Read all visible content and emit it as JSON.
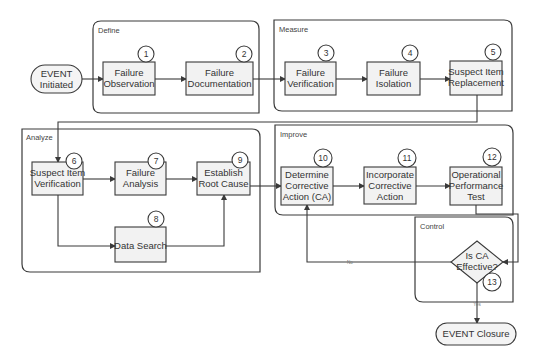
{
  "groups": {
    "define": "Define",
    "measure": "Measure",
    "analyze": "Analyze",
    "improve": "Improve",
    "control": "Control"
  },
  "terminals": {
    "start": [
      "EVENT",
      "Initiated"
    ],
    "end": "EVENT Closure"
  },
  "steps": [
    {
      "num": "1",
      "lines": [
        "Failure",
        "Observation"
      ]
    },
    {
      "num": "2",
      "lines": [
        "Failure",
        "Documentation"
      ]
    },
    {
      "num": "3",
      "lines": [
        "Failure",
        "Verification"
      ]
    },
    {
      "num": "4",
      "lines": [
        "Failure",
        "Isolation"
      ]
    },
    {
      "num": "5",
      "lines": [
        "Suspect Item",
        "Replacement"
      ]
    },
    {
      "num": "6",
      "lines": [
        "Suspect Item",
        "Verification"
      ]
    },
    {
      "num": "7",
      "lines": [
        "Failure",
        "Analysis"
      ]
    },
    {
      "num": "8",
      "lines": [
        "Data Search"
      ]
    },
    {
      "num": "9",
      "lines": [
        "Establish",
        "Root Cause"
      ]
    },
    {
      "num": "10",
      "lines": [
        "Determine",
        "Corrective",
        "Action (CA)"
      ]
    },
    {
      "num": "11",
      "lines": [
        "Incorporate",
        "Corrective",
        "Action"
      ]
    },
    {
      "num": "12",
      "lines": [
        "Operational",
        "Performance",
        "Test"
      ]
    }
  ],
  "decision": {
    "num": "13",
    "lines": [
      "Is CA",
      "Effective?"
    ],
    "no_label": "No",
    "yes_label": "Yes"
  }
}
